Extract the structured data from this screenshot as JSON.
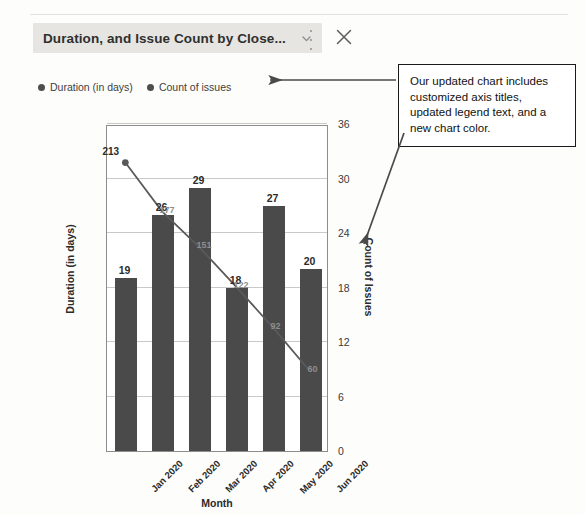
{
  "window": {
    "title": "Duration, and Issue Count by Close...",
    "chevron_icon": "chevron-down-icon",
    "more_icon": "more-vertical-icon",
    "close_icon": "close-icon"
  },
  "legend": {
    "items": [
      {
        "label": "Duration (in days)",
        "color": "#4e4e4e"
      },
      {
        "label": "Count of issues",
        "color": "#4e4e4e"
      }
    ]
  },
  "annotation": {
    "text": "Our updated chart includes customized axis titles, updated legend text, and a new chart color.",
    "border_color": "#1a1a1a",
    "arrow_color": "#4a4a4a"
  },
  "colors": {
    "bar": "#4a4a4a",
    "line": "#5a5a5a",
    "grid": "#c9c9c9",
    "axis": "#8d8d8d",
    "title_highlight": "#e6e5e2"
  },
  "background_text": {
    "left": "                        \n                            \n                                 \n                                \n                              \n                               \n                             \n                               \n                               \n                             \n                                \n                               \n                               \n                              \n                               \n                             \n                              \n                               \n                              \n                             \n                              ",
    "right": "                              \n                            \n                            \n                             \n                              \n                             \n                            \n                             \n                            \n                             \n                            \n                             \n                            \n                            \n                            ",
    "bottom": "                                    \n                                       \n                                      \n                                     "
  },
  "chart_data": {
    "type": "bar",
    "title": "Duration, and Issue Count by Close...",
    "xlabel": "Month",
    "ylabel": "Duration (in days)",
    "y2label": "Count of Issues",
    "grid": true,
    "legend_position": "top-left",
    "categories": [
      "Jan 2020",
      "Feb 2020",
      "Mar 2020",
      "Apr 2020",
      "May 2020",
      "Jun 2020"
    ],
    "y2ticks": [
      0,
      6,
      12,
      18,
      24,
      30,
      36
    ],
    "y2lim": [
      0,
      36
    ],
    "ylim": [
      0,
      240
    ],
    "series": [
      {
        "name": "Count of issues",
        "type": "bar",
        "axis": "right",
        "values": [
          19,
          26,
          29,
          18,
          27,
          20
        ]
      },
      {
        "name": "Duration (in days)",
        "type": "line",
        "axis": "left",
        "values": [
          213,
          177,
          151,
          122,
          92,
          60
        ]
      }
    ]
  }
}
